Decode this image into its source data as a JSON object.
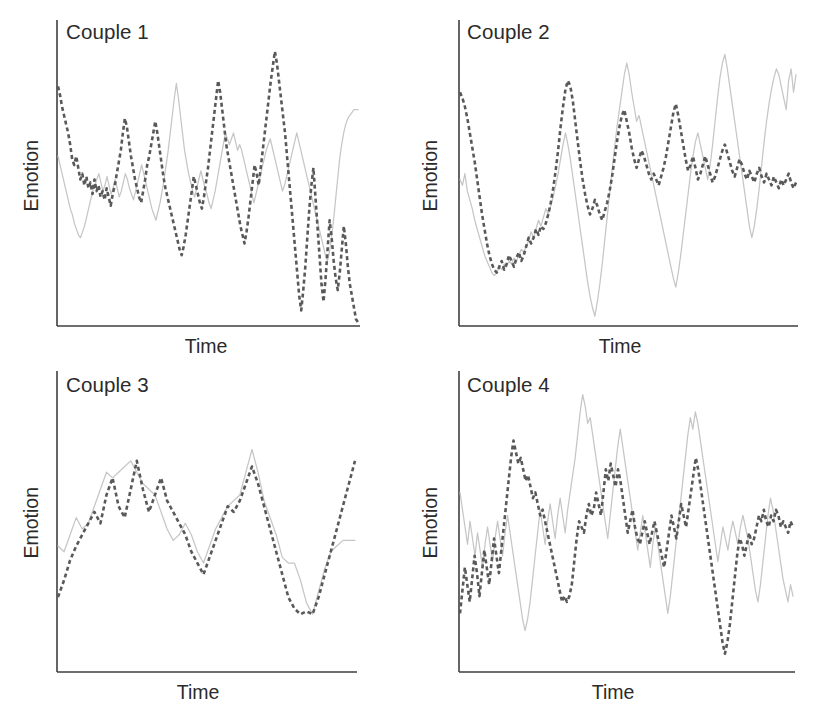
{
  "figure": {
    "background": "#ffffff",
    "axis_color": "#3f3f3f",
    "series_colors": {
      "dashed": "#595959",
      "solid": "#c6c6c6"
    },
    "dash_pattern": "4 3",
    "panel_count": 4
  },
  "panels": [
    {
      "title": "Couple 1",
      "xlabel": "Time",
      "ylabel": "Emotion"
    },
    {
      "title": "Couple 2",
      "xlabel": "Time",
      "ylabel": "Emotion"
    },
    {
      "title": "Couple 3",
      "xlabel": "Time",
      "ylabel": "Emotion"
    },
    {
      "title": "Couple 4",
      "xlabel": "Time",
      "ylabel": "Emotion"
    }
  ],
  "chart_data": [
    {
      "type": "line",
      "title": "Couple 1",
      "xlabel": "Time",
      "ylabel": "Emotion",
      "grid": false,
      "legend": "none",
      "xlim": [
        0,
        120
      ],
      "ylim": [
        0,
        100
      ],
      "description": "Two highly volatile, rapidly oscillating emotion traces with low synchrony; dashed partner shows extreme downward spikes late in the interaction.",
      "series": [
        {
          "name": "Partner A (dashed)",
          "style": "dashed",
          "color": "#595959",
          "values": [
            82,
            79,
            75,
            72,
            69,
            66,
            62,
            57,
            55,
            58,
            54,
            50,
            52,
            48,
            51,
            47,
            49,
            45,
            50,
            46,
            48,
            44,
            46,
            43,
            47,
            44,
            41,
            45,
            48,
            52,
            56,
            60,
            66,
            71,
            68,
            63,
            58,
            54,
            50,
            47,
            44,
            42,
            46,
            50,
            55,
            58,
            62,
            66,
            70,
            66,
            61,
            56,
            51,
            47,
            44,
            41,
            38,
            35,
            32,
            29,
            26,
            24,
            27,
            31,
            36,
            41,
            46,
            51,
            48,
            45,
            42,
            40,
            44,
            49,
            54,
            60,
            66,
            72,
            78,
            84,
            80,
            74,
            68,
            62,
            58,
            54,
            50,
            46,
            42,
            38,
            34,
            31,
            28,
            32,
            37,
            43,
            49,
            55,
            52,
            48,
            54,
            60,
            66,
            72,
            78,
            84,
            89,
            94,
            90,
            84,
            78,
            72,
            66,
            58,
            50,
            42,
            34,
            26,
            18,
            10,
            5,
            12,
            20,
            30,
            40,
            48,
            54,
            44,
            34,
            24,
            14,
            8,
            16,
            26,
            36,
            30,
            22,
            16,
            12,
            18,
            26,
            34,
            28,
            20,
            14,
            10,
            6,
            2,
            1
          ]
        },
        {
          "name": "Partner B (solid)",
          "style": "solid",
          "color": "#c6c6c6",
          "values": [
            58,
            55,
            52,
            49,
            46,
            43,
            40,
            38,
            35,
            33,
            31,
            30,
            32,
            34,
            37,
            40,
            43,
            46,
            48,
            50,
            52,
            49,
            46,
            48,
            51,
            48,
            45,
            47,
            50,
            47,
            44,
            46,
            49,
            52,
            50,
            47,
            45,
            43,
            46,
            49,
            52,
            55,
            52,
            49,
            46,
            43,
            40,
            38,
            36,
            39,
            42,
            46,
            50,
            55,
            60,
            66,
            72,
            78,
            83,
            78,
            72,
            66,
            60,
            56,
            52,
            49,
            46,
            44,
            47,
            50,
            53,
            50,
            47,
            45,
            42,
            40,
            43,
            46,
            50,
            54,
            58,
            62,
            66,
            64,
            62,
            64,
            66,
            63,
            60,
            62,
            60,
            57,
            54,
            51,
            48,
            45,
            42,
            45,
            48,
            51,
            54,
            57,
            60,
            62,
            64,
            61,
            58,
            55,
            52,
            49,
            46,
            48,
            51,
            54,
            57,
            60,
            63,
            66,
            63,
            60,
            57,
            54,
            51,
            48,
            45,
            42,
            39,
            36,
            33,
            30,
            27,
            24,
            22,
            25,
            30,
            36,
            43,
            50,
            57,
            62,
            66,
            69,
            71,
            72,
            73,
            74,
            74,
            74
          ]
        }
      ]
    },
    {
      "type": "line",
      "title": "Couple 2",
      "xlabel": "Time",
      "ylabel": "Emotion",
      "grid": false,
      "legend": "none",
      "xlim": [
        0,
        120
      ],
      "ylim": [
        0,
        100
      ],
      "description": "Dashed partner starts high and drops sharply, then both partners co-vary; the solid partner shows larger amplitude swings in the second half while the dashed partner flattens out.",
      "series": [
        {
          "name": "Partner A (dashed)",
          "style": "dashed",
          "color": "#595959",
          "values": [
            80,
            78,
            75,
            71,
            66,
            61,
            56,
            50,
            44,
            38,
            33,
            28,
            24,
            21,
            19,
            18,
            20,
            22,
            19,
            21,
            24,
            22,
            20,
            23,
            25,
            22,
            24,
            27,
            30,
            28,
            30,
            33,
            31,
            34,
            33,
            35,
            38,
            42,
            47,
            53,
            60,
            68,
            75,
            81,
            84,
            82,
            77,
            70,
            63,
            56,
            50,
            45,
            41,
            38,
            40,
            43,
            41,
            38,
            36,
            39,
            42,
            46,
            51,
            57,
            63,
            68,
            72,
            74,
            70,
            66,
            61,
            57,
            54,
            57,
            60,
            58,
            55,
            52,
            50,
            52,
            50,
            48,
            51,
            54,
            58,
            63,
            68,
            73,
            76,
            72,
            67,
            62,
            57,
            53,
            55,
            58,
            54,
            50,
            52,
            55,
            58,
            55,
            52,
            49,
            51,
            54,
            57,
            60,
            62,
            59,
            56,
            53,
            51,
            54,
            57,
            55,
            52,
            50,
            53,
            51,
            49,
            52,
            54,
            51,
            49,
            52,
            50,
            48,
            51,
            49,
            47,
            50,
            48,
            50,
            52,
            49,
            47,
            49
          ]
        },
        {
          "name": "Partner B (solid)",
          "style": "solid",
          "color": "#c6c6c6",
          "values": [
            50,
            48,
            52,
            46,
            43,
            40,
            36,
            33,
            30,
            27,
            24,
            22,
            20,
            18,
            17,
            18,
            20,
            19,
            21,
            20,
            22,
            21,
            23,
            22,
            24,
            26,
            25,
            27,
            29,
            32,
            30,
            33,
            36,
            34,
            37,
            40,
            38,
            41,
            44,
            48,
            52,
            57,
            62,
            66,
            62,
            57,
            51,
            45,
            39,
            33,
            27,
            21,
            15,
            10,
            6,
            3,
            8,
            14,
            21,
            29,
            37,
            45,
            53,
            61,
            68,
            74,
            80,
            86,
            90,
            86,
            80,
            75,
            70,
            72,
            68,
            64,
            60,
            56,
            52,
            48,
            44,
            40,
            36,
            32,
            28,
            24,
            20,
            16,
            13,
            18,
            24,
            31,
            38,
            45,
            52,
            58,
            63,
            66,
            62,
            58,
            54,
            50,
            55,
            62,
            70,
            78,
            85,
            90,
            93,
            88,
            82,
            76,
            70,
            64,
            58,
            52,
            46,
            40,
            34,
            30,
            34,
            40,
            47,
            55,
            63,
            70,
            76,
            81,
            85,
            88,
            86,
            82,
            78,
            74,
            84,
            88,
            80,
            86
          ]
        }
      ]
    },
    {
      "type": "line",
      "title": "Couple 3",
      "xlabel": "Time",
      "ylabel": "Emotion",
      "grid": false,
      "legend": "none",
      "xlim": [
        0,
        40
      ],
      "ylim": [
        0,
        100
      ],
      "description": "Smooth, slow-moving and strongly synchronized traces; both partners rise to a mid peak, dip, rise to a second higher peak, fall to a shared trough, then recover together at the end.",
      "series": [
        {
          "name": "Partner A (dashed)",
          "style": "dashed",
          "color": "#595959",
          "values": [
            26,
            32,
            39,
            44,
            48,
            52,
            56,
            52,
            62,
            68,
            58,
            54,
            64,
            74,
            64,
            56,
            62,
            68,
            60,
            56,
            52,
            48,
            42,
            38,
            34,
            40,
            46,
            52,
            58,
            56,
            60,
            66,
            72,
            66,
            58,
            50,
            42,
            34,
            26,
            22,
            20,
            21,
            20,
            26,
            34,
            42,
            50,
            58,
            66,
            74
          ]
        },
        {
          "name": "Partner B (solid)",
          "style": "solid",
          "color": "#c6c6c6",
          "values": [
            44,
            42,
            48,
            54,
            50,
            52,
            58,
            64,
            70,
            68,
            70,
            72,
            74,
            70,
            66,
            64,
            62,
            56,
            50,
            46,
            48,
            52,
            48,
            42,
            38,
            44,
            50,
            54,
            58,
            60,
            62,
            70,
            78,
            70,
            60,
            54,
            48,
            40,
            38,
            38,
            32,
            24,
            20,
            28,
            36,
            42,
            44,
            46,
            46,
            46
          ]
        }
      ]
    },
    {
      "type": "line",
      "title": "Couple 4",
      "xlabel": "Time",
      "ylabel": "Emotion",
      "grid": false,
      "legend": "none",
      "xlim": [
        0,
        120
      ],
      "ylim": [
        0,
        100
      ],
      "description": "Both partners fluctuate rapidly across the full range with little correspondence; the solid partner peaks highest mid-series while the dashed partner plunges to its lowest point late.",
      "series": [
        {
          "name": "Partner A (dashed)",
          "style": "dashed",
          "color": "#595959",
          "values": [
            20,
            28,
            36,
            30,
            24,
            32,
            40,
            34,
            26,
            34,
            42,
            36,
            30,
            38,
            46,
            40,
            34,
            42,
            50,
            58,
            66,
            74,
            80,
            76,
            72,
            74,
            70,
            66,
            68,
            64,
            60,
            62,
            58,
            54,
            56,
            52,
            48,
            44,
            40,
            36,
            32,
            28,
            24,
            26,
            24,
            26,
            30,
            38,
            46,
            52,
            50,
            48,
            54,
            58,
            54,
            56,
            62,
            58,
            54,
            62,
            70,
            66,
            72,
            68,
            64,
            70,
            66,
            60,
            54,
            48,
            52,
            56,
            50,
            46,
            44,
            48,
            52,
            48,
            44,
            48,
            52,
            48,
            44,
            40,
            36,
            42,
            48,
            54,
            50,
            46,
            52,
            58,
            54,
            50,
            56,
            62,
            68,
            74,
            70,
            64,
            58,
            52,
            46,
            40,
            34,
            28,
            22,
            16,
            10,
            6,
            10,
            16,
            24,
            32,
            40,
            46,
            44,
            40,
            44,
            48,
            44,
            46,
            50,
            54,
            52,
            56,
            52,
            50,
            54,
            52,
            56,
            54,
            50,
            52,
            50,
            48,
            52,
            50
          ]
        },
        {
          "name": "Partner B (solid)",
          "style": "solid",
          "color": "#c6c6c6",
          "values": [
            62,
            56,
            50,
            44,
            52,
            46,
            40,
            48,
            42,
            36,
            44,
            50,
            44,
            38,
            46,
            52,
            46,
            40,
            48,
            54,
            48,
            42,
            36,
            30,
            24,
            18,
            14,
            18,
            24,
            32,
            40,
            48,
            56,
            50,
            44,
            52,
            58,
            52,
            46,
            54,
            60,
            54,
            48,
            56,
            62,
            68,
            74,
            82,
            90,
            96,
            92,
            86,
            88,
            82,
            76,
            70,
            64,
            58,
            52,
            46,
            54,
            62,
            70,
            78,
            84,
            78,
            72,
            66,
            60,
            54,
            48,
            42,
            48,
            54,
            48,
            42,
            36,
            44,
            50,
            44,
            38,
            32,
            26,
            20,
            26,
            34,
            42,
            50,
            58,
            66,
            74,
            82,
            88,
            84,
            90,
            86,
            80,
            74,
            68,
            62,
            56,
            50,
            44,
            38,
            44,
            50,
            46,
            42,
            48,
            52,
            48,
            44,
            50,
            54,
            50,
            46,
            40,
            34,
            28,
            24,
            30,
            38,
            46,
            54,
            60,
            56,
            50,
            44,
            38,
            32,
            28,
            24,
            30,
            26
          ]
        }
      ]
    }
  ]
}
